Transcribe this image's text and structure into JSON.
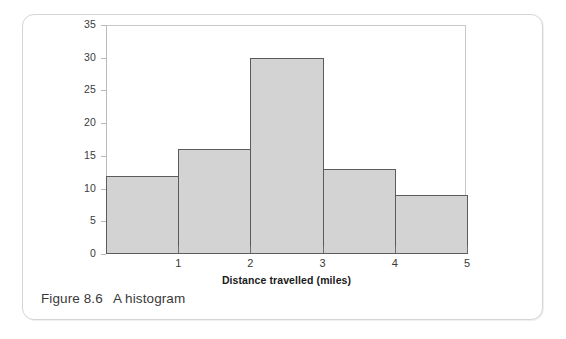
{
  "figure": {
    "caption_label": "Figure 8.6",
    "caption_text": "A histogram"
  },
  "colors": {
    "bar_fill": "#d3d3d3",
    "bar_stroke": "#5b5b5b",
    "frame": "#c9c9c9",
    "axis": "#6d6d6d",
    "text": "#3b3b3b",
    "card_border": "#d5d5d5",
    "background": "#ffffff"
  },
  "chart_data": {
    "type": "bar",
    "title": "",
    "subtitle": "",
    "xlabel": "Distance travelled (miles)",
    "ylabel": "",
    "categories": [
      "0-1",
      "1-2",
      "2-3",
      "3-4",
      "4-5"
    ],
    "bin_edges": [
      0,
      1,
      2,
      3,
      4,
      5
    ],
    "values": [
      12,
      16,
      30,
      13,
      9
    ],
    "series": [
      {
        "name": "Frequency",
        "values": [
          12,
          16,
          30,
          13,
          9
        ]
      }
    ],
    "xlim": [
      0,
      5
    ],
    "ylim": [
      0,
      35
    ],
    "x_ticks": [
      1,
      2,
      3,
      4,
      5
    ],
    "x_tick_labels": [
      "1",
      "2",
      "3",
      "4",
      "5"
    ],
    "y_ticks": [
      0,
      5,
      10,
      15,
      20,
      25,
      30,
      35
    ],
    "y_tick_labels": [
      "0",
      "5",
      "10",
      "15",
      "20",
      "25",
      "30",
      "35"
    ],
    "grid": false,
    "legend": false,
    "legend_position": "none"
  }
}
